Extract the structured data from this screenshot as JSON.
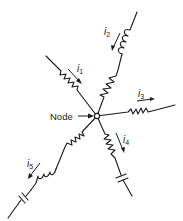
{
  "diagram": {
    "type": "circuit-node-branches",
    "node": {
      "label": "Node",
      "x": 97,
      "y": 116
    },
    "branches": [
      {
        "id": "i1",
        "current_label": "i",
        "current_sub": "1",
        "components": [
          "resistor"
        ],
        "direction": "toward-node",
        "end": [
          46,
          56
        ]
      },
      {
        "id": "i2",
        "current_label": "i",
        "current_sub": "2",
        "components": [
          "resistor",
          "inductor"
        ],
        "direction": "toward-node",
        "end": [
          137,
          12
        ]
      },
      {
        "id": "i3",
        "current_label": "i",
        "current_sub": "3",
        "components": [
          "resistor"
        ],
        "direction": "away-from-node",
        "end": [
          175,
          105
        ]
      },
      {
        "id": "i4",
        "current_label": "i",
        "current_sub": "4",
        "components": [
          "resistor",
          "capacitor"
        ],
        "direction": "away-from-node",
        "end": [
          132,
          196
        ]
      },
      {
        "id": "i5",
        "current_label": "i",
        "current_sub": "5",
        "components": [
          "resistor",
          "inductor",
          "capacitor"
        ],
        "direction": "away-from-node",
        "end": [
          8,
          218
        ]
      }
    ]
  }
}
